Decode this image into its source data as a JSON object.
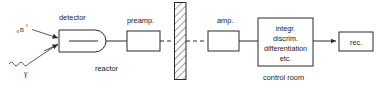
{
  "diagram": {
    "background_color": "#ffffff",
    "line_color": "#2b2b2b",
    "text_color": "#1a1a1a",
    "inputs": [
      {
        "id": "neutron",
        "symbol": "n",
        "subscript": "0",
        "superscript": "1",
        "ray_style": "straight-arrow"
      },
      {
        "id": "gamma",
        "symbol": "γ",
        "subscript": "",
        "superscript": "",
        "ray_style": "wavy-arrow"
      }
    ],
    "blocks": [
      {
        "id": "detector",
        "label": "detector",
        "shape": "d-shape",
        "label_position": "above"
      },
      {
        "id": "preamp",
        "label": "preamp.",
        "shape": "rect",
        "label_position": "above"
      },
      {
        "id": "amp",
        "label": "amp.",
        "shape": "rect",
        "label_position": "above"
      },
      {
        "id": "processing",
        "label_lines": [
          "integr.",
          "discrim.",
          "differentiation",
          "etc."
        ],
        "shape": "rect",
        "label_position": "inside"
      },
      {
        "id": "recorder",
        "label": "rec.",
        "shape": "rect",
        "label_position": "inside"
      }
    ],
    "area_labels": [
      {
        "id": "reactor",
        "label": "reactor"
      },
      {
        "id": "control-room",
        "label": "control room"
      }
    ],
    "barrier": {
      "id": "shielding-wall",
      "style": "diagonal-hatch",
      "label": ""
    },
    "connectors": [
      {
        "id": "detector-to-preamp",
        "style": "solid"
      },
      {
        "id": "preamp-to-wall",
        "style": "dashed"
      },
      {
        "id": "wall-to-amp",
        "style": "dashed"
      },
      {
        "id": "amp-to-processing",
        "style": "solid"
      },
      {
        "id": "processing-to-recorder",
        "style": "solid-arrow"
      }
    ]
  }
}
